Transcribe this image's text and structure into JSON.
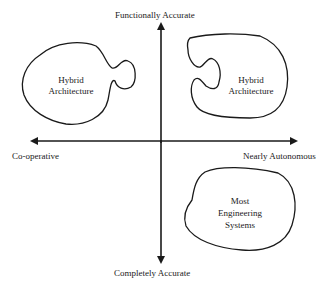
{
  "axes": {
    "top": "Functionally Accurate",
    "bottom": "Completely Accurate",
    "left": "Co-operative",
    "right": "Nearly Autonomous"
  },
  "regions": [
    {
      "id": "upper-left",
      "lines": [
        "Hybrid",
        "Architecture"
      ]
    },
    {
      "id": "upper-right",
      "lines": [
        "Hybrid",
        "Architecture"
      ]
    },
    {
      "id": "lower-right",
      "lines": [
        "Most",
        "Engineering",
        "Systems"
      ]
    }
  ],
  "colors": {
    "ink": "#1a1a1a",
    "background": "#ffffff"
  }
}
